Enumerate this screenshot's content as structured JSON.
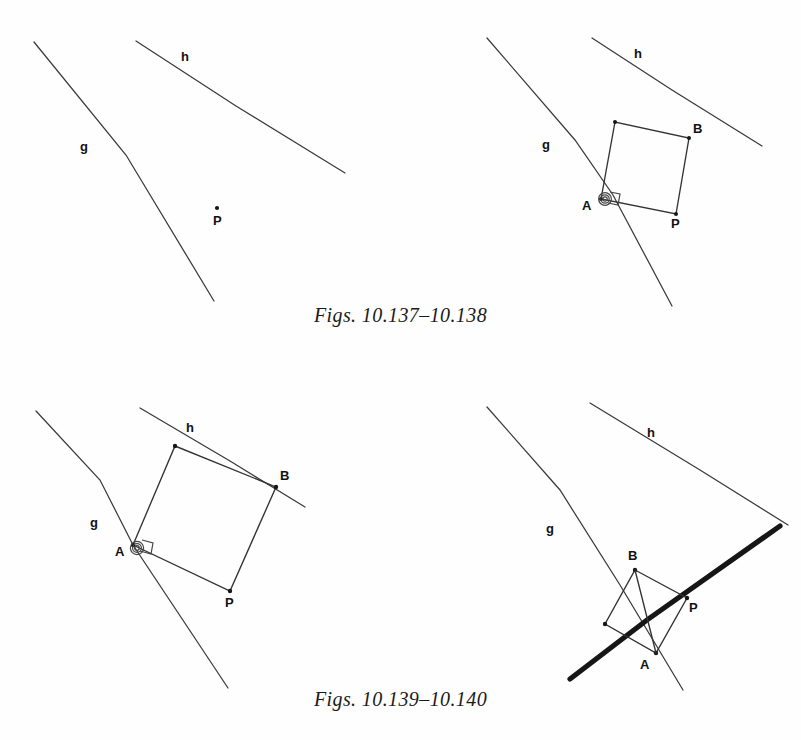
{
  "page": {
    "background": "#fefefe",
    "ink": "#2b2b2b",
    "label_color": "#111111",
    "width": 801,
    "height": 740
  },
  "captions": [
    {
      "text": "Figs. 10.137–10.138"
    },
    {
      "text": "Figs. 10.139–10.140"
    }
  ],
  "figures": [
    {
      "id": "fig-10-137",
      "title": "Figure 10.137",
      "description": "Two parallel lines g and h with a free point P between them",
      "labels": {
        "line_g": "g",
        "line_h": "h",
        "point_p": "P"
      }
    },
    {
      "id": "fig-10-138",
      "title": "Figure 10.138",
      "description": "Square A B P constructed with vertex A on line g, vertex B on line h, right angle marked at A",
      "labels": {
        "line_g": "g",
        "line_h": "h",
        "point_a": "A",
        "point_b": "B",
        "point_p": "P"
      }
    },
    {
      "id": "fig-10-139",
      "title": "Figure 10.139",
      "description": "Larger square with A on line g and B on line h, right angle marker at A",
      "labels": {
        "line_g": "g",
        "line_h": "h",
        "point_a": "A",
        "point_b": "B",
        "point_p": "P"
      }
    },
    {
      "id": "fig-10-140",
      "title": "Figure 10.140",
      "description": "Square with A below, B on a thick bold line crossing lines g and h",
      "labels": {
        "line_g": "g",
        "line_h": "h",
        "point_a": "A",
        "point_b": "B",
        "point_p": "P"
      }
    }
  ]
}
